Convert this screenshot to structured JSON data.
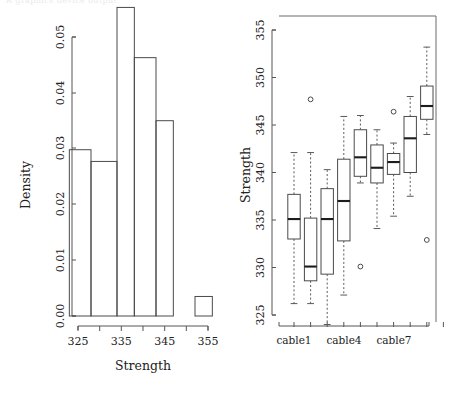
{
  "figure": {
    "top_note": "R graphics device output",
    "panels": [
      "histogram-panel",
      "boxplot-panel"
    ]
  },
  "chart_data": [
    {
      "type": "bar",
      "name": "histogram",
      "title": "",
      "xlabel": "Strength",
      "ylabel": "Density",
      "xlim": [
        323,
        357
      ],
      "ylim": [
        0,
        0.055
      ],
      "grid": false,
      "legend": "none",
      "xticks": [
        325,
        330,
        335,
        340,
        345,
        350,
        355
      ],
      "xtick_labels": [
        "325",
        "",
        "335",
        "",
        "345",
        "",
        "355"
      ],
      "yticks": [
        0.0,
        0.01,
        0.02,
        0.03,
        0.04,
        0.05
      ],
      "ytick_labels": [
        "0.00",
        "0.01",
        "0.02",
        "0.03",
        "0.04",
        "0.05"
      ],
      "bin_edges": [
        323,
        328,
        331,
        334,
        337,
        340,
        343,
        346,
        349,
        352,
        355,
        357
      ],
      "bins": [
        {
          "from": 323,
          "to": 328,
          "density": 0.0298
        },
        {
          "from": 328,
          "to": 334,
          "density": 0.0277
        },
        {
          "from": 334,
          "to": 338,
          "density": 0.0553
        },
        {
          "from": 338,
          "to": 343,
          "density": 0.0463
        },
        {
          "from": 343,
          "to": 347,
          "density": 0.035
        },
        {
          "from": 347,
          "to": 352,
          "density": 0.0
        },
        {
          "from": 352,
          "to": 356,
          "density": 0.0035
        }
      ],
      "categories": [
        "323-328",
        "328-334",
        "334-338",
        "338-343",
        "343-347",
        "347-352",
        "352-356"
      ],
      "values": [
        0.0298,
        0.0277,
        0.0553,
        0.0463,
        0.035,
        0.0,
        0.0035
      ]
    },
    {
      "type": "boxplot",
      "name": "strength-by-cable",
      "title": "",
      "xlabel": "",
      "ylabel": "Strength",
      "ylim": [
        323.5,
        356
      ],
      "grid": false,
      "legend": "none",
      "yticks": [
        325,
        330,
        335,
        340,
        345,
        350,
        355
      ],
      "ytick_labels": [
        "325",
        "330",
        "335",
        "340",
        "345",
        "350",
        "355"
      ],
      "xtick_labels": [
        "cable1",
        "",
        "",
        "cable4",
        "",
        "",
        "cable7",
        "",
        "",
        ""
      ],
      "categories": [
        "cable1",
        "cable2",
        "cable3",
        "cable4",
        "cable5",
        "cable6",
        "cable7",
        "cable8",
        "cable9",
        "cable10"
      ],
      "boxes": [
        {
          "category": "cable1",
          "lower_whisker": 326.2,
          "q1": 333.0,
          "median": 335.1,
          "q3": 337.7,
          "upper_whisker": 342.1,
          "outliers": []
        },
        {
          "category": "cable2",
          "lower_whisker": 326.2,
          "q1": 328.6,
          "median": 330.1,
          "q3": 335.2,
          "upper_whisker": 342.1,
          "outliers": [
            347.7
          ]
        },
        {
          "category": "cable3",
          "lower_whisker": 324.0,
          "q1": 329.3,
          "median": 335.1,
          "q3": 338.3,
          "upper_whisker": 340.3,
          "outliers": []
        },
        {
          "category": "cable4",
          "lower_whisker": 327.1,
          "q1": 332.8,
          "median": 337.0,
          "q3": 341.4,
          "upper_whisker": 345.9,
          "outliers": []
        },
        {
          "category": "cable5",
          "lower_whisker": 338.9,
          "q1": 339.6,
          "median": 341.6,
          "q3": 344.5,
          "upper_whisker": 346.0,
          "outliers": [
            330.1
          ]
        },
        {
          "category": "cable6",
          "lower_whisker": 334.1,
          "q1": 338.9,
          "median": 340.5,
          "q3": 342.9,
          "upper_whisker": 344.5,
          "outliers": []
        },
        {
          "category": "cable7",
          "lower_whisker": 335.4,
          "q1": 339.8,
          "median": 341.1,
          "q3": 342.0,
          "upper_whisker": 343.1,
          "outliers": [
            346.4
          ]
        },
        {
          "category": "cable8",
          "lower_whisker": 337.5,
          "q1": 340.0,
          "median": 343.6,
          "q3": 345.9,
          "upper_whisker": 348.0,
          "outliers": []
        },
        {
          "category": "cable9",
          "lower_whisker": 344.0,
          "q1": 345.6,
          "median": 347.0,
          "q3": 349.1,
          "upper_whisker": 353.2,
          "outliers": [
            332.9
          ]
        }
      ]
    }
  ],
  "histogram": {
    "ylabel": "Density",
    "xlabel": "Strength",
    "ytick_labels": [
      "0.00",
      "0.01",
      "0.02",
      "0.03",
      "0.04",
      "0.05"
    ],
    "xtick_labels": [
      "325",
      "335",
      "345",
      "355"
    ]
  },
  "boxplot": {
    "ylabel": "Strength",
    "ytick_labels": [
      "325",
      "330",
      "335",
      "340",
      "345",
      "350",
      "355"
    ],
    "xtick_labels": [
      "cable1",
      "cable4",
      "cable7"
    ]
  }
}
